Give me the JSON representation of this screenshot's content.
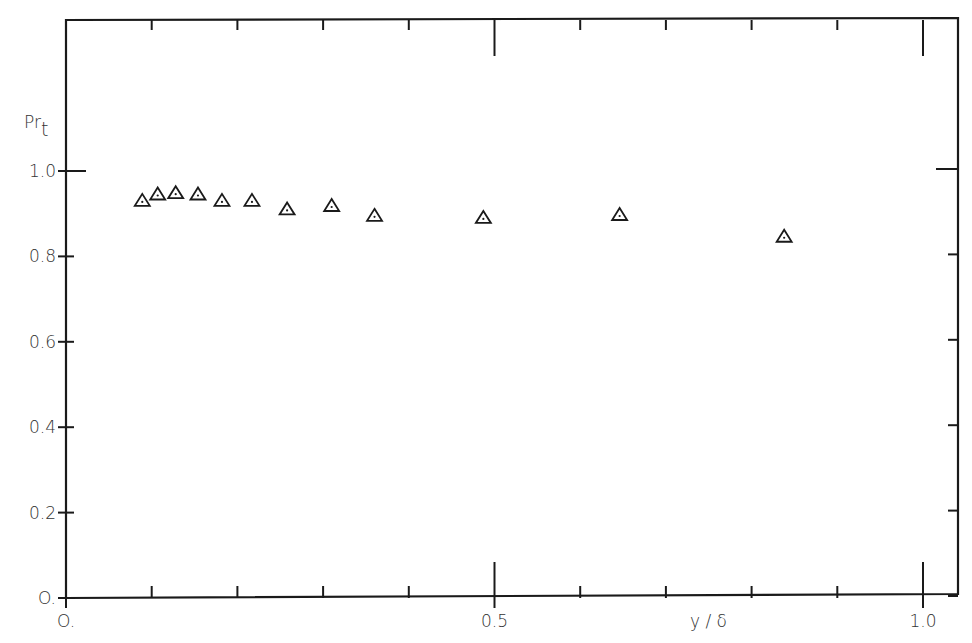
{
  "chart_data": {
    "type": "scatter",
    "title": "",
    "xlabel": "y / δ",
    "ylabel": "Pr_t",
    "ylabel_main": "Pr",
    "ylabel_sub": "t",
    "xlim": [
      0.0,
      1.0
    ],
    "ylim": [
      0.0,
      1.0
    ],
    "x_ticks": [
      0.0,
      0.1,
      0.2,
      0.3,
      0.4,
      0.5,
      0.6,
      0.7,
      0.8,
      0.9,
      1.0
    ],
    "x_tick_labels": [
      {
        "value": 0.0,
        "label": "O."
      },
      {
        "value": 0.5,
        "label": "0.5"
      },
      {
        "value": 1.0,
        "label": "1.0"
      }
    ],
    "y_ticks": [
      0.0,
      0.2,
      0.4,
      0.6,
      0.8,
      1.0
    ],
    "y_tick_labels": [
      {
        "value": 0.0,
        "label": "O."
      },
      {
        "value": 0.2,
        "label": "0.2"
      },
      {
        "value": 0.4,
        "label": "0.4"
      },
      {
        "value": 0.6,
        "label": "0.6"
      },
      {
        "value": 0.8,
        "label": "0.8"
      },
      {
        "value": 1.0,
        "label": "1.0"
      }
    ],
    "grid": false,
    "legend": null,
    "marker": "triangle-with-center-dot",
    "series": [
      {
        "name": "Pr_t",
        "x": [
          0.089,
          0.107,
          0.128,
          0.154,
          0.182,
          0.217,
          0.258,
          0.31,
          0.36,
          0.487,
          0.646,
          0.838
        ],
        "y": [
          0.93,
          0.945,
          0.948,
          0.945,
          0.93,
          0.93,
          0.91,
          0.918,
          0.895,
          0.89,
          0.897,
          0.846
        ]
      }
    ]
  }
}
